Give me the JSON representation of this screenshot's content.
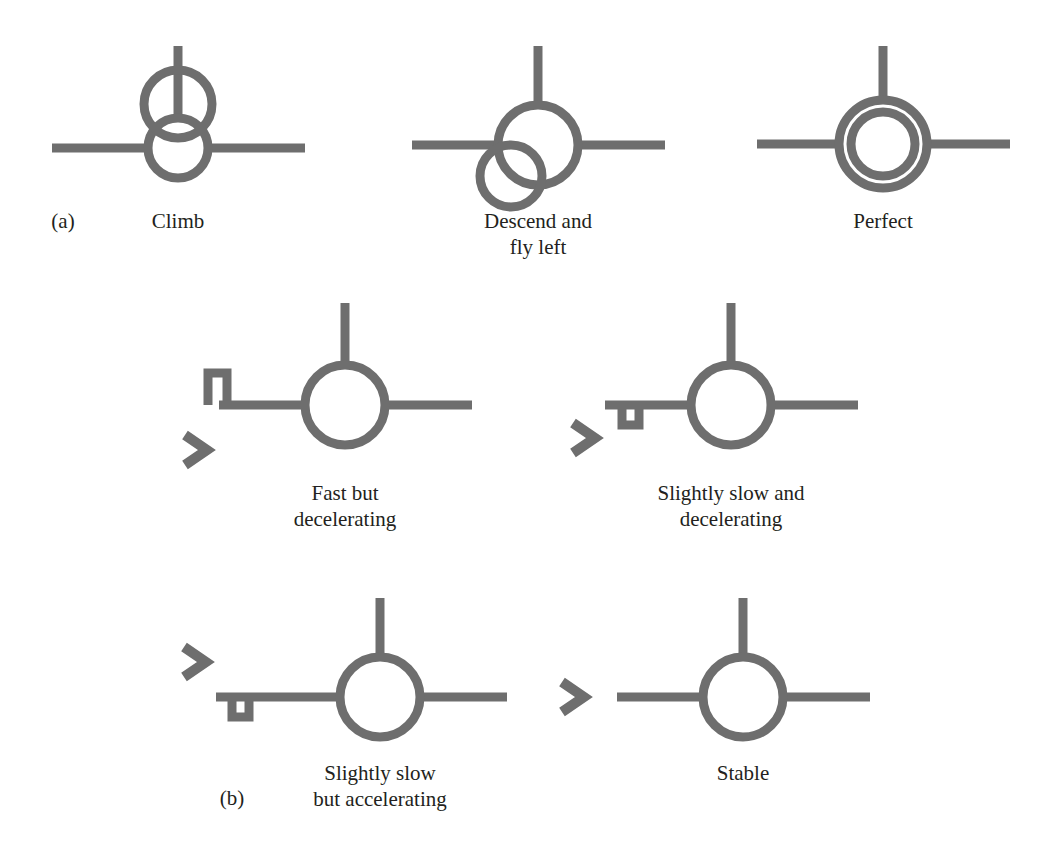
{
  "figure": {
    "background_color": "#ffffff",
    "symbol_color": "#6e6e6e",
    "text_color": "#231f20",
    "panels": [
      {
        "id": "a",
        "label": "(a)",
        "label_x": 63,
        "label_y": 228
      },
      {
        "id": "b",
        "label": "(b)",
        "label_x": 232,
        "label_y": 805
      }
    ],
    "symbols": [
      {
        "key": "climb",
        "caption_lines": [
          "Climb"
        ],
        "caption_x": 178,
        "caption_y": 228,
        "kind": "offset-circle",
        "center_x": 178,
        "center_y": 148,
        "radius": 30,
        "wing_left_x": 52,
        "wing_right_x": 305,
        "tail_top_y": 46,
        "offset_circle_x": 178,
        "offset_circle_y": 104,
        "offset_circle_r": 34
      },
      {
        "key": "descend-fly-left",
        "caption_lines": [
          "Descend and",
          "fly left"
        ],
        "caption_x": 538,
        "caption_y": 228,
        "kind": "offset-circle",
        "center_x": 538,
        "center_y": 145,
        "radius": 40,
        "wing_left_x": 412,
        "wing_right_x": 665,
        "tail_top_y": 46,
        "offset_circle_x": 511,
        "offset_circle_y": 176,
        "offset_circle_r": 31
      },
      {
        "key": "perfect",
        "caption_lines": [
          "Perfect"
        ],
        "caption_x": 883,
        "caption_y": 228,
        "kind": "concentric",
        "center_x": 883,
        "center_y": 144,
        "radius": 44,
        "inner_radius": 32,
        "wing_left_x": 757,
        "wing_right_x": 1010,
        "tail_top_y": 46
      },
      {
        "key": "fast-but-decelerating",
        "caption_lines": [
          "Fast but",
          "decelerating"
        ],
        "caption_x": 345,
        "caption_y": 500,
        "kind": "speed",
        "center_x": 345,
        "center_y": 405,
        "radius": 40,
        "wing_left_x": 219,
        "wing_right_x": 472,
        "tail_top_y": 303,
        "notch": "tall-up",
        "notch_x": 208,
        "notch_width": 19,
        "notch_height": 32,
        "chevron_x": 196,
        "chevron_y": 450
      },
      {
        "key": "slightly-slow-and-decelerating",
        "caption_lines": [
          "Slightly slow and",
          "decelerating"
        ],
        "caption_x": 731,
        "caption_y": 500,
        "kind": "speed",
        "center_x": 731,
        "center_y": 405,
        "radius": 40,
        "wing_left_x": 605,
        "wing_right_x": 858,
        "tail_top_y": 303,
        "notch": "small-down",
        "notch_x": 622,
        "notch_width": 17,
        "notch_height": 20,
        "chevron_x": 584,
        "chevron_y": 438
      },
      {
        "key": "slightly-slow-but-accelerating",
        "caption_lines": [
          "Slightly slow",
          "but accelerating"
        ],
        "caption_x": 380,
        "caption_y": 780,
        "kind": "speed",
        "center_x": 380,
        "center_y": 697,
        "radius": 40,
        "wing_left_x": 216,
        "wing_right_x": 507,
        "tail_top_y": 598,
        "notch": "small-down",
        "notch_x": 232,
        "notch_width": 17,
        "notch_height": 20,
        "chevron_x": 195,
        "chevron_y": 662
      },
      {
        "key": "stable",
        "caption_lines": [
          "Stable"
        ],
        "caption_x": 743,
        "caption_y": 780,
        "kind": "speed",
        "center_x": 743,
        "center_y": 697,
        "radius": 40,
        "wing_left_x": 617,
        "wing_right_x": 870,
        "tail_top_y": 598,
        "notch": "none",
        "chevron_x": 573,
        "chevron_y": 697
      }
    ]
  }
}
